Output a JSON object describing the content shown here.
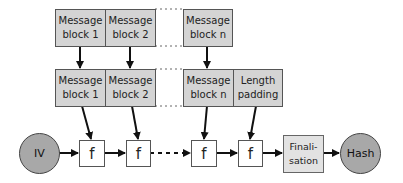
{
  "diagram": {
    "type": "Merkle-Damgard hash construction",
    "input_row": [
      {
        "label": "Message\nblock 1"
      },
      {
        "label": "Message\nblock 2"
      },
      {
        "label": "Message\nblock n"
      }
    ],
    "padded_row": [
      {
        "label": "Message\nblock 1"
      },
      {
        "label": "Message\nblock 2"
      },
      {
        "label": "Message\nblock n"
      },
      {
        "label": "Length\npadding"
      }
    ],
    "chain": {
      "iv": "IV",
      "functions": [
        "f",
        "f",
        "f",
        "f"
      ],
      "finalisation": "Finali-\nsation",
      "output": "Hash"
    },
    "colors": {
      "block_fill": "#d4d4d4",
      "circle_fill": "#a8a8a8",
      "finalisation_fill": "#e2e2e2",
      "stroke": "#222222"
    }
  }
}
